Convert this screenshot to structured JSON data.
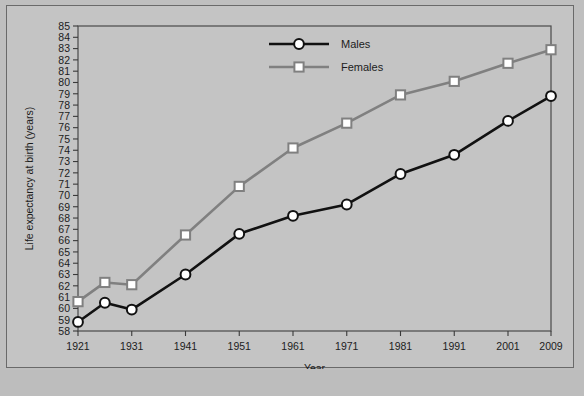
{
  "chart_data": {
    "type": "line",
    "title": "",
    "xlabel": "Year",
    "ylabel": "Life expectancy at birth (years)",
    "x": [
      1921,
      1926,
      1931,
      1941,
      1951,
      1961,
      1971,
      1981,
      1991,
      2001,
      2009
    ],
    "xticks": [
      1921,
      1931,
      1941,
      1951,
      1961,
      1971,
      1981,
      1991,
      2001,
      2009
    ],
    "xticklabels": [
      "1921",
      "1931",
      "1941",
      "1951",
      "1961",
      "1971",
      "1981",
      "1991",
      "2001",
      "2009"
    ],
    "xlim": [
      1921,
      2009
    ],
    "ylim": [
      58,
      85
    ],
    "yticks": [
      58,
      59,
      60,
      61,
      62,
      63,
      64,
      65,
      66,
      67,
      68,
      69,
      70,
      71,
      72,
      73,
      74,
      75,
      76,
      77,
      78,
      79,
      80,
      81,
      82,
      83,
      84,
      85
    ],
    "yticklabels": [
      "58",
      "59",
      "60",
      "61",
      "62",
      "63",
      "64",
      "65",
      "66",
      "67",
      "68",
      "69",
      "70",
      "71",
      "72",
      "73",
      "74",
      "75",
      "76",
      "77",
      "78",
      "79",
      "80",
      "81",
      "82",
      "83",
      "84",
      "85"
    ],
    "grid": false,
    "legend_position": "top-center",
    "series": [
      {
        "name": "Males",
        "color": "#111111",
        "marker": "circle",
        "values": [
          58.8,
          60.5,
          59.9,
          63.0,
          66.6,
          68.2,
          69.2,
          71.9,
          73.6,
          76.6,
          78.8
        ]
      },
      {
        "name": "Females",
        "color": "#808080",
        "marker": "square",
        "values": [
          60.6,
          62.3,
          62.1,
          66.5,
          70.8,
          74.2,
          76.4,
          78.9,
          80.1,
          81.7,
          82.9
        ]
      }
    ]
  },
  "legend": {
    "items": [
      {
        "label": "Males"
      },
      {
        "label": "Females"
      }
    ]
  },
  "bottom": {
    "caption": ""
  }
}
